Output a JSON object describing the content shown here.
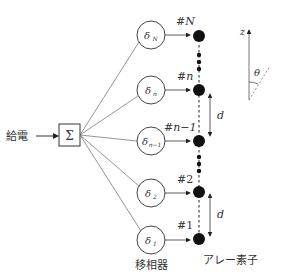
{
  "feed_label": "給電",
  "sum_symbol": "Σ",
  "phase_shifter_label": "移相器",
  "array_element_label": "アレー素子",
  "spacing_label": "d",
  "axis_label": "z",
  "angle_label": "θ",
  "elements": [
    {
      "phase": "δ",
      "phase_sub": "N",
      "tag": "#",
      "tag_var": "N"
    },
    {
      "phase": "δ",
      "phase_sub": "n",
      "tag": "#",
      "tag_var": "n"
    },
    {
      "phase": "δ",
      "phase_sub": "n−1",
      "tag": "#",
      "tag_var": "n−1"
    },
    {
      "phase": "δ",
      "phase_sub": "2",
      "tag": "#",
      "tag_var": "2"
    },
    {
      "phase": "δ",
      "phase_sub": "1",
      "tag": "#",
      "tag_var": "1"
    }
  ],
  "colors": {
    "line": "#555555",
    "dot": "#111111",
    "text": "#333333"
  }
}
